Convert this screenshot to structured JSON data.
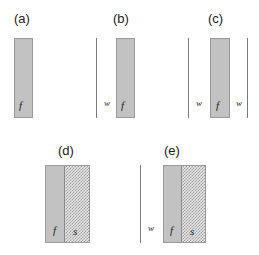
{
  "figure": {
    "title": "",
    "background_color": "#ffffff",
    "width": 259,
    "height": 255,
    "fluid_fill_color": "#c2c2c2",
    "solid_hatch_color": "#9e9e9e",
    "line_color": "#7a7a7a"
  },
  "panels": [
    {
      "id": "a",
      "label": "(a)",
      "label_x": 14,
      "label_y": 12,
      "slab": {
        "x": 14,
        "y": 38,
        "width": 19,
        "height": 80
      },
      "regions": [
        {
          "key": "f",
          "label": "f",
          "type": "fluid",
          "width_pct": 100,
          "label_x": 19,
          "label_y": 100
        }
      ],
      "walls": [],
      "gap_labels": []
    },
    {
      "id": "b",
      "label": "(b)",
      "label_x": 113,
      "label_y": 12,
      "slab": {
        "x": 116,
        "y": 38,
        "width": 19,
        "height": 80
      },
      "regions": [
        {
          "key": "f",
          "label": "f",
          "type": "fluid",
          "width_pct": 100,
          "label_x": 121,
          "label_y": 100
        }
      ],
      "walls": [
        {
          "x": 96,
          "y": 38,
          "height": 80
        }
      ],
      "gap_labels": [
        {
          "text": "w",
          "x": 104,
          "y": 99
        }
      ]
    },
    {
      "id": "c",
      "label": "(c)",
      "label_x": 208,
      "label_y": 12,
      "slab": {
        "x": 210,
        "y": 38,
        "width": 20,
        "height": 80
      },
      "regions": [
        {
          "key": "f",
          "label": "f",
          "type": "fluid",
          "width_pct": 100,
          "label_x": 216,
          "label_y": 100
        }
      ],
      "walls": [
        {
          "x": 188,
          "y": 38,
          "height": 80
        },
        {
          "x": 247,
          "y": 38,
          "height": 80
        }
      ],
      "gap_labels": [
        {
          "text": "w",
          "x": 196,
          "y": 99
        },
        {
          "text": "w",
          "x": 236,
          "y": 99
        }
      ]
    },
    {
      "id": "d",
      "label": "(d)",
      "label_x": 58,
      "label_y": 144,
      "slab": {
        "x": 45,
        "y": 165,
        "width": 45,
        "height": 78
      },
      "regions": [
        {
          "key": "f",
          "label": "f",
          "type": "fluid",
          "width_pct": 42,
          "label_x": 53,
          "label_y": 225
        },
        {
          "key": "s",
          "label": "s",
          "type": "solid",
          "width_pct": 58,
          "label_x": 73,
          "label_y": 226
        }
      ],
      "walls": [],
      "gap_labels": []
    },
    {
      "id": "e",
      "label": "(e)",
      "label_x": 164,
      "label_y": 144,
      "slab": {
        "x": 163,
        "y": 165,
        "width": 43,
        "height": 78
      },
      "regions": [
        {
          "key": "f",
          "label": "f",
          "type": "fluid",
          "width_pct": 42,
          "label_x": 170,
          "label_y": 225
        },
        {
          "key": "s",
          "label": "s",
          "type": "solid",
          "width_pct": 58,
          "label_x": 190,
          "label_y": 226
        }
      ],
      "walls": [
        {
          "x": 140,
          "y": 165,
          "height": 78
        }
      ],
      "gap_labels": [
        {
          "text": "w",
          "x": 148,
          "y": 224
        }
      ]
    }
  ]
}
